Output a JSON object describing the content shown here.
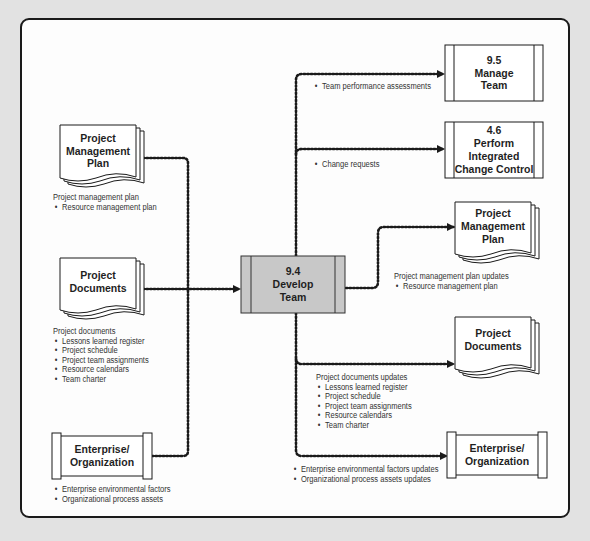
{
  "diagram": {
    "colors": {
      "background": "#e2e2e2",
      "frame": "#fdfdfd",
      "process_fill": "#c8c8c8",
      "line": "#1a1a1a"
    },
    "center": {
      "id": "9.4",
      "line1": "9.4",
      "line2": "Develop",
      "line3": "Team",
      "text": "9.4\nDevelop\nTeam"
    },
    "inputs": [
      {
        "name": "Project Management Plan",
        "text": "Project\nManagement\nPlan",
        "shape": "document",
        "label_title": "Project management plan",
        "items": [
          "Resource management plan"
        ]
      },
      {
        "name": "Project Documents",
        "text": "Project\nDocuments",
        "shape": "document",
        "label_title": "Project documents",
        "items": [
          "Lessons learned register",
          "Project schedule",
          "Project team assignments",
          "Resource calendars",
          "Team charter"
        ]
      },
      {
        "name": "Enterprise/Organization",
        "text": "Enterprise/\nOrganization",
        "shape": "scroll",
        "label_title": "",
        "items": [
          "Enterprise environmental factors",
          "Organizational process assets"
        ]
      }
    ],
    "outputs": [
      {
        "name": "9.5 Manage Team",
        "text": "9.5\nManage\nTeam",
        "shape": "process",
        "label_title": "",
        "items": [
          "Team performance assessments"
        ]
      },
      {
        "name": "4.6 Perform Integrated Change Control",
        "text": "4.6\nPerform\nIntegrated\nChange Control",
        "shape": "process",
        "label_title": "",
        "items": [
          "Change requests"
        ]
      },
      {
        "name": "Project Management Plan",
        "text": "Project\nManagement\nPlan",
        "shape": "document",
        "label_title": "Project management plan updates",
        "items": [
          "Resource management plan"
        ]
      },
      {
        "name": "Project Documents",
        "text": "Project\nDocuments",
        "shape": "document",
        "label_title": "Project documents updates",
        "items": [
          "Lessons learned register",
          "Project schedule",
          "Project team assignments",
          "Resource calendars",
          "Team charter"
        ]
      },
      {
        "name": "Enterprise/Organization",
        "text": "Enterprise/\nOrganization",
        "shape": "scroll",
        "label_title": "",
        "items": [
          "Enterprise environmental factors updates",
          "Organizational process assets updates"
        ]
      }
    ]
  }
}
